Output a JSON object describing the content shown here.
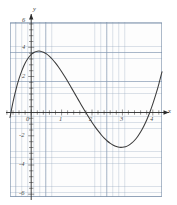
{
  "figure": {
    "name": "cubic-function-graph",
    "background": "#ffffff",
    "grid_color": "#8296af",
    "curve_color": "#3a3a3a",
    "axis_color": "#2b2b2b"
  },
  "axis_names": {
    "x": "x",
    "y": "y"
  },
  "chart_data": {
    "type": "line",
    "title": "",
    "subtitle": "",
    "xlabel": "x",
    "ylabel": "y",
    "xlim": [
      -0.7,
      4.3
    ],
    "ylim": [
      -6,
      6
    ],
    "grid": true,
    "minor_grid": true,
    "legend": "none",
    "x_ticks": [
      0,
      1,
      2,
      3,
      4
    ],
    "x_tick_labels": [
      "0",
      "1",
      "2",
      "3",
      "4"
    ],
    "y_ticks": [
      -6,
      -4,
      -2,
      2,
      4,
      6
    ],
    "y_tick_labels": [
      "-6",
      "-4",
      "-2",
      "2",
      "4",
      "6"
    ],
    "minor_tick_step_x": 0.2,
    "minor_tick_step_y": 0.2,
    "annotations": [
      {
        "label": "local maximum",
        "x": 0.3,
        "y": 4.0
      },
      {
        "label": "local minimum",
        "x": 2.75,
        "y": -5.0
      },
      {
        "label": "x-intercept",
        "x": 1.25,
        "y": 0
      },
      {
        "label": "x-intercept",
        "x": 3.8,
        "y": 0
      },
      {
        "label": "y-intercept",
        "x": 0,
        "y": 3.5
      }
    ],
    "series": [
      {
        "name": "cubic curve",
        "color": "#3a3a3a",
        "x": [
          -0.7,
          -0.6,
          -0.5,
          -0.4,
          -0.3,
          -0.2,
          -0.1,
          0.0,
          0.1,
          0.2,
          0.3,
          0.4,
          0.5,
          0.6,
          0.7,
          0.8,
          0.9,
          1.0,
          1.1,
          1.2,
          1.3,
          1.4,
          1.5,
          1.6,
          1.7,
          1.8,
          1.9,
          2.0,
          2.1,
          2.2,
          2.3,
          2.4,
          2.5,
          2.6,
          2.7,
          2.8,
          2.9,
          3.0,
          3.1,
          3.2,
          3.3,
          3.4,
          3.5,
          3.6,
          3.7,
          3.8,
          3.9,
          4.0,
          4.1,
          4.2,
          4.3
        ],
        "y": [
          -0.55,
          0.52,
          1.4,
          2.13,
          2.72,
          3.19,
          3.53,
          3.78,
          3.93,
          4.0,
          4.0,
          3.93,
          3.81,
          3.64,
          3.43,
          3.18,
          2.9,
          2.59,
          2.26,
          1.92,
          1.56,
          1.2,
          0.84,
          0.48,
          0.12,
          -0.23,
          -0.57,
          -0.89,
          -1.19,
          -1.47,
          -1.73,
          -1.96,
          -2.16,
          -2.32,
          -2.45,
          -2.54,
          -2.59,
          -2.59,
          -2.55,
          -2.46,
          -2.31,
          -2.11,
          -1.85,
          -1.53,
          -1.15,
          -0.7,
          -0.19,
          0.4,
          1.05,
          1.78,
          2.58
        ]
      }
    ]
  },
  "curve_path": "M 10.6,116.5 L 13.1,113.9 L 15.2,111.6 L 17.5,109.2 L 20.1,106.6 L 22.6,104.2 L 25.1,101.9 L 27.6,99.9 L 30.0,98.2 L 32.6,46.6 L 35.0,46.3 L 37.5,46.2 L 40.0,46.4 L 42.5,46.9 L 45.0,47.7 L 47.5,48.8 L 50.0,50.2 L 52.5,51.9 L 55.0,53.8 L 57.5,56.0 L 60.0,58.4 L 62.5,61.0 L 65.0,63.8 L 67.5,66.8 L 70.0,70.0 L 72.5,73.3 L 75.0,76.7 L 77.5,80.2 L 80.0,83.8 L 82.5,87.4 L 85.0,91.1 L 87.5,94.7 L 90.0,98.4 L 92.5,102.0 L 95.0,105.5 L 97.5,108.9 L 100.0,112.2 L 102.5,115.4 L 105.0,118.3 L 107.5,121.1 L 110.0,123.6 L 112.5,125.8 L 115.0,127.8 L 117.5,129.4 L 120.0,130.7 L 122.5,131.6 L 125.0,132.1 L 127.5,132.2 L 130.0,131.9 L 132.5,131.1 L 135.0,129.8 L 137.5,128.1 L 140.0,125.8 L 142.5,123.0 L 145.0,119.7 L 147.5,115.8 L 150.0,111.3 L 152.5,106.2 L 155.0,100.5 L 157.5,94.2 L 160.0,87.2 L 162.0,46.0"
}
